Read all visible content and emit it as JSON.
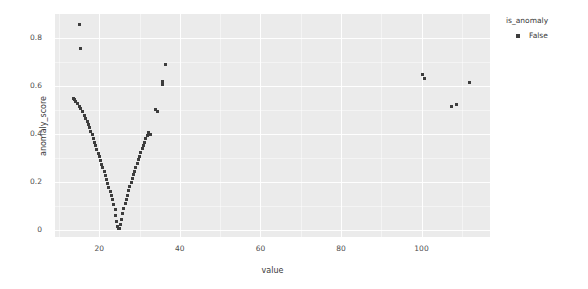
{
  "chart_data": {
    "type": "scatter",
    "title": "",
    "xlabel": "value",
    "ylabel": "anomaly_score",
    "xlim": [
      9,
      117
    ],
    "ylim": [
      -0.03,
      0.9
    ],
    "xticks": [
      20,
      40,
      60,
      80,
      100
    ],
    "yticks": [
      "0",
      "0.2",
      "0.4",
      "0.6",
      "0.8"
    ],
    "grid": true,
    "legend": {
      "title": "is_anomaly",
      "position": "right",
      "entries": [
        {
          "label": "False",
          "marker": "square",
          "color": "#3d3d3d"
        }
      ]
    },
    "marker": {
      "shape": "square",
      "size": 3,
      "color": "#3d3d3d"
    },
    "series": [
      {
        "name": "False",
        "color": "#3d3d3d",
        "points": [
          [
            15.0,
            0.858
          ],
          [
            15.4,
            0.757
          ],
          [
            13.6,
            0.548
          ],
          [
            13.9,
            0.542
          ],
          [
            14.2,
            0.535
          ],
          [
            14.6,
            0.526
          ],
          [
            15.0,
            0.513
          ],
          [
            15.4,
            0.505
          ],
          [
            15.8,
            0.492
          ],
          [
            16.2,
            0.478
          ],
          [
            16.6,
            0.466
          ],
          [
            17.0,
            0.452
          ],
          [
            17.3,
            0.438
          ],
          [
            17.6,
            0.425
          ],
          [
            17.9,
            0.41
          ],
          [
            18.2,
            0.396
          ],
          [
            18.5,
            0.381
          ],
          [
            18.8,
            0.366
          ],
          [
            19.1,
            0.35
          ],
          [
            19.4,
            0.336
          ],
          [
            19.7,
            0.32
          ],
          [
            20.0,
            0.305
          ],
          [
            20.3,
            0.289
          ],
          [
            20.6,
            0.273
          ],
          [
            20.9,
            0.258
          ],
          [
            21.2,
            0.242
          ],
          [
            21.5,
            0.226
          ],
          [
            21.8,
            0.21
          ],
          [
            22.1,
            0.193
          ],
          [
            22.4,
            0.177
          ],
          [
            22.7,
            0.16
          ],
          [
            23.0,
            0.143
          ],
          [
            23.3,
            0.125
          ],
          [
            23.6,
            0.105
          ],
          [
            23.9,
            0.083
          ],
          [
            24.1,
            0.06
          ],
          [
            24.3,
            0.035
          ],
          [
            24.5,
            0.012
          ],
          [
            24.7,
            0.004
          ],
          [
            24.9,
            0.006
          ],
          [
            25.2,
            0.022
          ],
          [
            25.5,
            0.044
          ],
          [
            25.8,
            0.066
          ],
          [
            26.1,
            0.088
          ],
          [
            26.4,
            0.108
          ],
          [
            26.7,
            0.127
          ],
          [
            27.0,
            0.145
          ],
          [
            27.3,
            0.163
          ],
          [
            27.6,
            0.18
          ],
          [
            27.9,
            0.197
          ],
          [
            28.2,
            0.213
          ],
          [
            28.5,
            0.229
          ],
          [
            28.8,
            0.245
          ],
          [
            29.1,
            0.261
          ],
          [
            29.4,
            0.277
          ],
          [
            29.7,
            0.292
          ],
          [
            30.0,
            0.307
          ],
          [
            30.3,
            0.322
          ],
          [
            30.6,
            0.337
          ],
          [
            30.9,
            0.352
          ],
          [
            31.2,
            0.366
          ],
          [
            31.5,
            0.38
          ],
          [
            31.9,
            0.394
          ],
          [
            32.3,
            0.406
          ],
          [
            34.0,
            0.503
          ],
          [
            34.4,
            0.495
          ],
          [
            35.6,
            0.618
          ],
          [
            35.8,
            0.608
          ],
          [
            36.5,
            0.69
          ],
          [
            32.6,
            0.399
          ],
          [
            100.2,
            0.648
          ],
          [
            100.8,
            0.632
          ],
          [
            107.5,
            0.513
          ],
          [
            108.6,
            0.524
          ],
          [
            111.8,
            0.616
          ]
        ]
      }
    ]
  }
}
